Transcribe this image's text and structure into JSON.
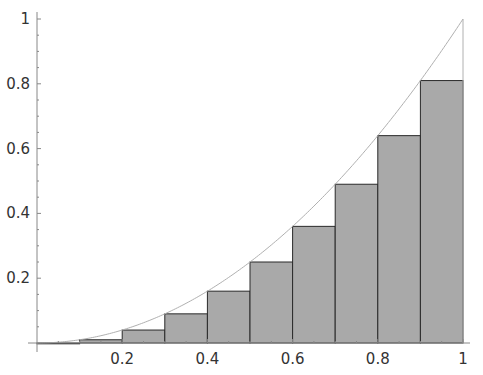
{
  "chart_data": {
    "type": "bar",
    "title": "",
    "xlabel": "",
    "ylabel": "",
    "curve": {
      "function": "x^2",
      "x_range": [
        0,
        1
      ]
    },
    "categories": [
      "0.0-0.1",
      "0.1-0.2",
      "0.2-0.3",
      "0.3-0.4",
      "0.4-0.5",
      "0.5-0.6",
      "0.6-0.7",
      "0.7-0.8",
      "0.8-0.9",
      "0.9-1.0"
    ],
    "x": [
      0.0,
      0.1,
      0.2,
      0.3,
      0.4,
      0.5,
      0.6,
      0.7,
      0.8,
      0.9
    ],
    "bar_width": 0.1,
    "values": [
      0.0,
      0.01,
      0.04,
      0.09,
      0.16,
      0.25,
      0.36,
      0.49,
      0.64,
      0.81
    ],
    "xlim": [
      0,
      1
    ],
    "ylim": [
      0,
      1
    ],
    "x_ticks": [
      {
        "value": 0.2,
        "label": "0.2"
      },
      {
        "value": 0.4,
        "label": "0.4"
      },
      {
        "value": 0.6,
        "label": "0.6"
      },
      {
        "value": 0.8,
        "label": "0.8"
      },
      {
        "value": 1,
        "label": "1"
      }
    ],
    "y_ticks": [
      {
        "value": 0.2,
        "label": "0.2"
      },
      {
        "value": 0.4,
        "label": "0.4"
      },
      {
        "value": 0.6,
        "label": "0.6"
      },
      {
        "value": 0.8,
        "label": "0.8"
      },
      {
        "value": 1,
        "label": "1"
      }
    ],
    "grid": false,
    "legend": null,
    "colors": {
      "bar_fill": "#a9a9a9",
      "bar_edge": "#2a2a2a",
      "curve": "#b0b0b0",
      "axis": "#888888"
    }
  }
}
